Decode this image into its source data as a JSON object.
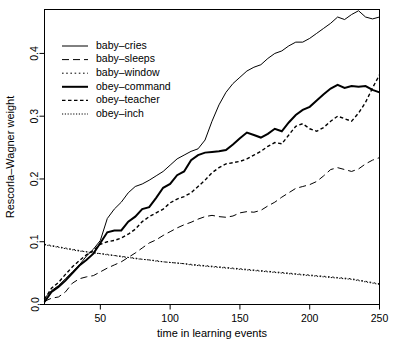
{
  "chart_data": {
    "type": "line",
    "title": "",
    "xlabel": "time in learning events",
    "ylabel": "Rescorla–Wagner weight",
    "xlim": [
      10,
      250
    ],
    "ylim": [
      0.0,
      0.47
    ],
    "grid": false,
    "legend_position": "top-left",
    "xticks": [
      50,
      100,
      150,
      200,
      250
    ],
    "xtick_labels": [
      "50",
      "100",
      "150",
      "200",
      "250"
    ],
    "yticks": [
      0.0,
      0.1,
      0.2,
      0.3,
      0.4
    ],
    "ytick_labels": [
      "0.0",
      "0.1",
      "0.2",
      "0.3",
      "0.4"
    ],
    "x": [
      10,
      15,
      20,
      25,
      30,
      35,
      40,
      45,
      50,
      55,
      60,
      65,
      70,
      75,
      80,
      85,
      90,
      95,
      100,
      105,
      110,
      115,
      120,
      125,
      130,
      135,
      140,
      145,
      150,
      155,
      160,
      165,
      170,
      175,
      180,
      185,
      190,
      195,
      200,
      205,
      210,
      215,
      220,
      225,
      230,
      235,
      240,
      245,
      250
    ],
    "series": [
      {
        "name": "baby–cries",
        "style": "solid",
        "width": 1,
        "color": "#000000",
        "values": [
          0.01,
          0.022,
          0.03,
          0.041,
          0.052,
          0.063,
          0.077,
          0.088,
          0.102,
          0.137,
          0.152,
          0.163,
          0.178,
          0.188,
          0.192,
          0.198,
          0.205,
          0.212,
          0.222,
          0.232,
          0.238,
          0.244,
          0.248,
          0.262,
          0.292,
          0.318,
          0.338,
          0.352,
          0.362,
          0.372,
          0.378,
          0.382,
          0.392,
          0.4,
          0.404,
          0.412,
          0.418,
          0.418,
          0.424,
          0.432,
          0.44,
          0.448,
          0.458,
          0.454,
          0.462,
          0.468,
          0.458,
          0.455,
          0.458
        ]
      },
      {
        "name": "baby–sleeps",
        "style": "dashed",
        "width": 1,
        "color": "#000000",
        "values": [
          0.005,
          0.01,
          0.012,
          0.02,
          0.034,
          0.041,
          0.044,
          0.046,
          0.052,
          0.058,
          0.063,
          0.068,
          0.075,
          0.082,
          0.09,
          0.098,
          0.103,
          0.11,
          0.116,
          0.122,
          0.127,
          0.131,
          0.136,
          0.14,
          0.142,
          0.14,
          0.139,
          0.141,
          0.146,
          0.148,
          0.147,
          0.15,
          0.157,
          0.163,
          0.171,
          0.178,
          0.185,
          0.188,
          0.191,
          0.196,
          0.205,
          0.215,
          0.218,
          0.215,
          0.212,
          0.216,
          0.224,
          0.23,
          0.234
        ]
      },
      {
        "name": "baby–window",
        "style": "dotted",
        "width": 1,
        "color": "#000000",
        "values": [
          0.096,
          0.094,
          0.092,
          0.09,
          0.088,
          0.086,
          0.084,
          0.083,
          0.081,
          0.08,
          0.078,
          0.077,
          0.075,
          0.074,
          0.072,
          0.071,
          0.07,
          0.068,
          0.067,
          0.066,
          0.065,
          0.064,
          0.063,
          0.062,
          0.061,
          0.06,
          0.059,
          0.058,
          0.057,
          0.056,
          0.055,
          0.054,
          0.053,
          0.052,
          0.051,
          0.05,
          0.049,
          0.048,
          0.047,
          0.046,
          0.045,
          0.044,
          0.043,
          0.042,
          0.041,
          0.039,
          0.037,
          0.035,
          0.033
        ]
      },
      {
        "name": "obey–command",
        "style": "solid",
        "width": 2,
        "color": "#000000",
        "values": [
          0.004,
          0.02,
          0.028,
          0.038,
          0.05,
          0.062,
          0.071,
          0.081,
          0.098,
          0.115,
          0.118,
          0.118,
          0.132,
          0.14,
          0.152,
          0.155,
          0.17,
          0.186,
          0.192,
          0.206,
          0.212,
          0.23,
          0.238,
          0.242,
          0.243,
          0.244,
          0.246,
          0.255,
          0.265,
          0.274,
          0.27,
          0.266,
          0.272,
          0.28,
          0.276,
          0.29,
          0.302,
          0.31,
          0.315,
          0.325,
          0.335,
          0.344,
          0.35,
          0.345,
          0.348,
          0.347,
          0.348,
          0.342,
          0.338
        ]
      },
      {
        "name": "obey–teacher",
        "style": "dashed-short",
        "width": 1.4,
        "color": "#000000",
        "values": [
          0.008,
          0.026,
          0.035,
          0.048,
          0.06,
          0.07,
          0.079,
          0.086,
          0.096,
          0.1,
          0.102,
          0.106,
          0.112,
          0.12,
          0.132,
          0.14,
          0.146,
          0.152,
          0.162,
          0.168,
          0.172,
          0.178,
          0.188,
          0.198,
          0.21,
          0.218,
          0.224,
          0.226,
          0.228,
          0.232,
          0.238,
          0.244,
          0.252,
          0.258,
          0.256,
          0.27,
          0.284,
          0.288,
          0.28,
          0.276,
          0.282,
          0.292,
          0.3,
          0.296,
          0.292,
          0.305,
          0.322,
          0.345,
          0.366
        ]
      },
      {
        "name": "obey–inch",
        "style": "dotted-fine",
        "width": 1,
        "color": "#000000",
        "values": [
          0.095,
          0.093,
          0.091,
          0.089,
          0.087,
          0.085,
          0.084,
          0.082,
          0.081,
          0.079,
          0.078,
          0.076,
          0.075,
          0.073,
          0.072,
          0.071,
          0.069,
          0.068,
          0.067,
          0.066,
          0.065,
          0.063,
          0.062,
          0.061,
          0.06,
          0.059,
          0.058,
          0.057,
          0.056,
          0.055,
          0.054,
          0.053,
          0.052,
          0.051,
          0.05,
          0.049,
          0.048,
          0.047,
          0.046,
          0.045,
          0.044,
          0.043,
          0.042,
          0.041,
          0.04,
          0.038,
          0.036,
          0.034,
          0.032
        ]
      }
    ]
  },
  "legend": {
    "entries": [
      {
        "label": "baby–cries"
      },
      {
        "label": "baby–sleeps"
      },
      {
        "label": "baby–window"
      },
      {
        "label": "obey–command"
      },
      {
        "label": "obey–teacher"
      },
      {
        "label": "obey–inch"
      }
    ]
  }
}
